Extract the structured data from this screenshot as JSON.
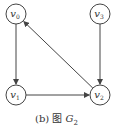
{
  "diagram": {
    "caption": {
      "prefix": "(b) 图 ",
      "var": "G",
      "sub": "2"
    },
    "nodes": [
      {
        "id": "v0",
        "label": "v",
        "sub": "0",
        "x": 16,
        "y": 14
      },
      {
        "id": "v3",
        "label": "v",
        "sub": "3",
        "x": 100,
        "y": 14
      },
      {
        "id": "v1",
        "label": "v",
        "sub": "1",
        "x": 16,
        "y": 95
      },
      {
        "id": "v2",
        "label": "v",
        "sub": "2",
        "x": 100,
        "y": 95
      }
    ],
    "edges": [
      {
        "from": "v0",
        "to": "v1"
      },
      {
        "from": "v1",
        "to": "v2"
      },
      {
        "from": "v3",
        "to": "v2"
      },
      {
        "from": "v2",
        "to": "v0"
      }
    ],
    "colors": {
      "stroke": "#444444"
    }
  }
}
